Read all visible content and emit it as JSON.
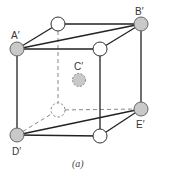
{
  "figure": {
    "caption": "(a)",
    "colors": {
      "edge": "#222222",
      "hidden_edge": "#888888",
      "labeled_atom_fill": "#c9c9c9",
      "unlabeled_atom_fill": "#ffffff"
    },
    "atoms": [
      {
        "id": "A",
        "label": "A′",
        "type": "gray"
      },
      {
        "id": "top-back-left",
        "label": "",
        "type": "white"
      },
      {
        "id": "B",
        "label": "B′",
        "type": "gray"
      },
      {
        "id": "top-front-right",
        "label": "",
        "type": "white"
      },
      {
        "id": "C",
        "label": "C′",
        "type": "gray-hidden"
      },
      {
        "id": "bottom-back-left",
        "label": "",
        "type": "hidden"
      },
      {
        "id": "E",
        "label": "E′",
        "type": "gray"
      },
      {
        "id": "D",
        "label": "D′",
        "type": "gray"
      },
      {
        "id": "bottom-front-right",
        "label": "",
        "type": "white"
      }
    ]
  }
}
